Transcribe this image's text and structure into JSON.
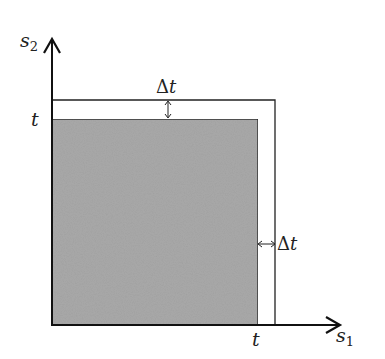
{
  "diagram": {
    "type": "region-diagram",
    "axes": {
      "x_label": "s",
      "x_subscript": "1",
      "y_label": "s",
      "y_subscript": "2"
    },
    "ticks": {
      "x_tick": "t",
      "y_tick": "t"
    },
    "increments": {
      "top_label_delta": "Δ",
      "top_label_var": "t",
      "right_label_delta": "Δ",
      "right_label_var": "t"
    },
    "regions": {
      "inner_square": "[0, t] × [0, t] (shaded)",
      "outer_square": "[0, t+Δt] × [0, t+Δt] (outline)"
    },
    "colors": {
      "shade": "#a9a9a9",
      "line": "#222222",
      "background": "#ffffff"
    }
  }
}
